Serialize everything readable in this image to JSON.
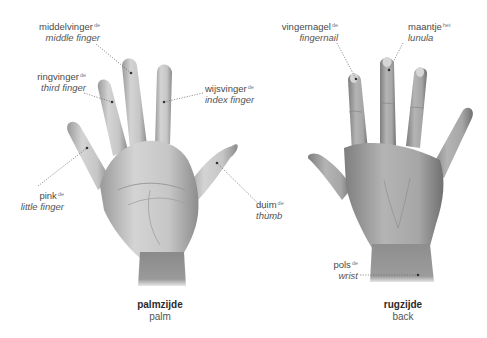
{
  "palm_side": {
    "caption": {
      "title": "palmzijde",
      "subtitle": "palm"
    },
    "labels": {
      "middle_finger": {
        "dutch": "middelvinger",
        "article": "de",
        "english": "middle finger"
      },
      "third_finger": {
        "dutch": "ringvinger",
        "article": "de",
        "english": "third finger"
      },
      "index_finger": {
        "dutch": "wijsvinger",
        "article": "de",
        "english": "index finger"
      },
      "little_finger": {
        "dutch": "pink",
        "article": "de",
        "english": "little finger"
      },
      "thumb": {
        "dutch": "duim",
        "article": "de",
        "english": "thumb"
      }
    }
  },
  "back_side": {
    "caption": {
      "title": "rugzijde",
      "subtitle": "back"
    },
    "labels": {
      "fingernail": {
        "dutch": "vingernagel",
        "article": "de",
        "english": "fingernail"
      },
      "lunula": {
        "dutch": "maantje",
        "article": "het",
        "english": "lunula"
      },
      "wrist": {
        "dutch": "pols",
        "article": "de",
        "english": "wrist"
      }
    }
  },
  "colors": {
    "text": "#4a4a4a",
    "leader_line": "#666666",
    "skin_light": "#d8d8d8",
    "skin_dark": "#8a8a8a"
  }
}
